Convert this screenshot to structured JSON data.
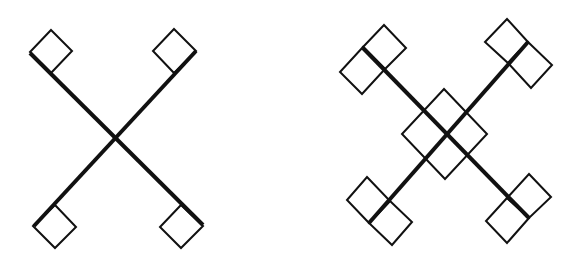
{
  "colors": {
    "background": "#ffffff",
    "stroke": "#111111"
  },
  "figures": [
    {
      "name": "single-square-cross",
      "arms": [
        {
          "from": [
            30,
            53
          ],
          "to": [
            203,
            225
          ]
        },
        {
          "from": [
            196,
            51
          ],
          "to": [
            34,
            226
          ]
        }
      ],
      "squares": [
        [
          [
            51,
            30
          ],
          [
            72,
            51
          ],
          [
            51,
            73
          ],
          [
            30,
            52
          ]
        ],
        [
          [
            174,
            29
          ],
          [
            196,
            51
          ],
          [
            174,
            73
          ],
          [
            153,
            51
          ]
        ],
        [
          [
            55,
            205
          ],
          [
            76,
            227
          ],
          [
            55,
            248
          ],
          [
            33,
            226
          ]
        ],
        [
          [
            181,
            205
          ],
          [
            203,
            226
          ],
          [
            181,
            248
          ],
          [
            160,
            227
          ]
        ]
      ]
    },
    {
      "name": "double-square-cross",
      "arms": [
        {
          "from": [
            363,
            48
          ],
          "to": [
            529,
            218
          ]
        },
        {
          "from": [
            528,
            42
          ],
          "to": [
            369,
            223
          ]
        }
      ],
      "squares": [
        [
          [
            384,
            25
          ],
          [
            406,
            48
          ],
          [
            385,
            69
          ],
          [
            363,
            47
          ]
        ],
        [
          [
            363,
            47
          ],
          [
            385,
            69
          ],
          [
            362,
            94
          ],
          [
            340,
            72
          ]
        ],
        [
          [
            507,
            19
          ],
          [
            528,
            42
          ],
          [
            508,
            63
          ],
          [
            485,
            42
          ]
        ],
        [
          [
            528,
            42
          ],
          [
            552,
            65
          ],
          [
            531,
            88
          ],
          [
            508,
            63
          ]
        ],
        [
          [
            444,
            89
          ],
          [
            487,
            134
          ],
          [
            445,
            179
          ],
          [
            402,
            134
          ]
        ],
        [
          [
            367,
            177
          ],
          [
            390,
            201
          ],
          [
            369,
            223
          ],
          [
            347,
            200
          ]
        ],
        [
          [
            390,
            201
          ],
          [
            412,
            222
          ],
          [
            392,
            245
          ],
          [
            369,
            223
          ]
        ],
        [
          [
            529,
            174
          ],
          [
            551,
            197
          ],
          [
            529,
            218
          ],
          [
            507,
            198
          ]
        ],
        [
          [
            507,
            198
          ],
          [
            529,
            218
          ],
          [
            507,
            243
          ],
          [
            486,
            221
          ]
        ]
      ]
    }
  ]
}
